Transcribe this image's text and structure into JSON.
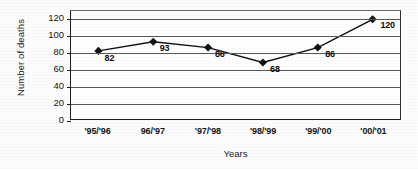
{
  "chart_data": {
    "type": "line",
    "title": "",
    "xlabel": "Years",
    "ylabel": "Number of deaths",
    "categories": [
      "'95/'96",
      "96/'97",
      "'97/'98",
      "'98/'99",
      "'99/'00",
      "'00/'01"
    ],
    "values": [
      82,
      93,
      86,
      68,
      86,
      120
    ],
    "data_labels": [
      "82",
      "93",
      "86",
      "68",
      "86",
      "120"
    ],
    "ylim": [
      0,
      130
    ],
    "yticks": [
      0,
      20,
      40,
      60,
      80,
      100,
      120
    ],
    "ytick_labels": [
      "0",
      "20",
      "40",
      "60",
      "80",
      "100",
      "120"
    ],
    "grid": "horizontal",
    "legend": "none",
    "series": [
      {
        "name": "Number of deaths",
        "values": [
          82,
          93,
          86,
          68,
          86,
          120
        ],
        "marker": "diamond",
        "marker_color": "#111111",
        "line_color": "#111111"
      }
    ],
    "colors": {
      "line": "#111111",
      "marker": "#111111",
      "gridline": "#585858",
      "axis": "#1a1a1a",
      "text": "#141414",
      "background": "#ffffff"
    }
  }
}
